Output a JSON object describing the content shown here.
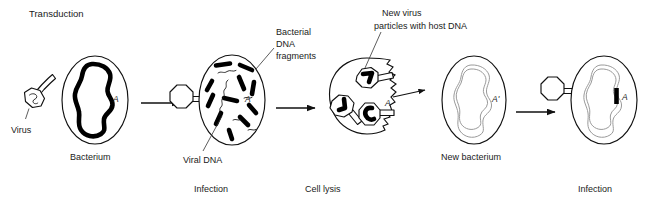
{
  "figure": {
    "title": "Transduction",
    "background_color": "#ffffff",
    "ink_color": "#111111",
    "gray_dna_color": "#9a9a9a"
  },
  "labels": {
    "virus": "Virus",
    "bacterium": "Bacterium",
    "bacterial_dna_fragments": "Bacterial\nDNA\nfragments",
    "bacterial_dna_fragments_line1": "Bacterial",
    "bacterial_dna_fragments_line2": "DNA",
    "bacterial_dna_fragments_line3": "fragments",
    "viral_dna": "Viral DNA",
    "new_virus_particles_line1": "New virus",
    "new_virus_particles_line2": "particles with host DNA",
    "new_bacterium": "New bacterium",
    "gene_a": "A",
    "gene_a_prime": "A'"
  },
  "captions": {
    "infection_1": "Infection",
    "cell_lysis": "Cell lysis",
    "infection_2": "Infection"
  },
  "stages": [
    {
      "id": "stage-1",
      "name": "virus-and-bacterium",
      "caption": "",
      "elements": [
        "virus particle",
        "bacterium with bacterial DNA labeled A"
      ]
    },
    {
      "id": "stage-2",
      "name": "infection",
      "caption": "Infection",
      "elements": [
        "virus attached to cell",
        "bacterial DNA fragments",
        "viral DNA strands"
      ]
    },
    {
      "id": "stage-3",
      "name": "cell-lysis",
      "caption": "Cell lysis",
      "elements": [
        "lysing cell",
        "three new virus particles with host DNA",
        "one labeled A"
      ]
    },
    {
      "id": "stage-4",
      "name": "new-bacterium",
      "caption": "",
      "elements": [
        "new bacterium with DNA labeled A prime"
      ]
    },
    {
      "id": "stage-5",
      "name": "infection-transduced",
      "caption": "Infection",
      "elements": [
        "virus attached to new bacterium",
        "transduced gene A inserted in DNA"
      ]
    }
  ]
}
